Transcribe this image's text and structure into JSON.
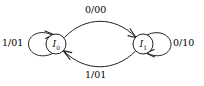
{
  "figure": {
    "kind": "state-transition-diagram",
    "background_color": "#ffffff",
    "stroke_color": "#222222",
    "text_color": "#111111"
  },
  "states": [
    {
      "id": "I0",
      "name": "I",
      "subscript": "0",
      "cx": 56,
      "cy": 44,
      "r": 10
    },
    {
      "id": "I1",
      "name": "I",
      "subscript": "1",
      "cx": 143,
      "cy": 44,
      "r": 10
    }
  ],
  "transitions": [
    {
      "id": "t-top",
      "from": "I0",
      "to": "I1",
      "label": "0/00",
      "shape": "arc-upper"
    },
    {
      "id": "t-bottom",
      "from": "I1",
      "to": "I0",
      "label": "1/01",
      "shape": "arc-lower"
    },
    {
      "id": "t-left-loop",
      "from": "I0",
      "to": "I0",
      "label": "1/01",
      "shape": "self-loop-left"
    },
    {
      "id": "t-right-loop",
      "from": "I1",
      "to": "I1",
      "label": "0/10",
      "shape": "self-loop-right"
    }
  ],
  "labels": {
    "top": "0/00",
    "bottom": "1/01",
    "left": "1/01",
    "right": "0/10"
  }
}
